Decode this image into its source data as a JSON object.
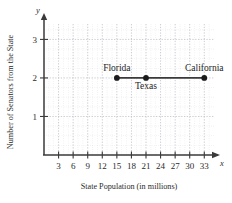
{
  "chart_data": {
    "type": "scatter",
    "title": "",
    "xlabel": "State Population (in millions)",
    "ylabel": "Number of Senators from the State",
    "xlim": [
      0,
      35
    ],
    "ylim": [
      0,
      3.4
    ],
    "xticks": [
      3,
      6,
      9,
      12,
      15,
      18,
      21,
      24,
      27,
      30,
      33
    ],
    "yticks": [
      1,
      2,
      3
    ],
    "xtick_labels": [
      "3",
      "6",
      "9",
      "12",
      "15",
      "18",
      "21",
      "24",
      "27",
      "30",
      "33"
    ],
    "ytick_labels": [
      "1",
      "2",
      "3"
    ],
    "x_axis_variable": "x",
    "y_axis_variable": "y",
    "grid": true,
    "grid_style": "dotted",
    "legend": "none",
    "connected": true,
    "line_color": "#3a3a3a",
    "point_color": "#1a1a1a",
    "axis_color": "#3a3a3a",
    "grid_color": "#cfcfd6",
    "points": [
      {
        "label": "Florida",
        "x": 15,
        "y": 2,
        "label_position": "above"
      },
      {
        "label": "Texas",
        "x": 21,
        "y": 2,
        "label_position": "below"
      },
      {
        "label": "California",
        "x": 33,
        "y": 2,
        "label_position": "above"
      }
    ],
    "series": [
      {
        "name": "States",
        "x": [
          15,
          21,
          33
        ],
        "values": [
          2,
          2,
          2
        ]
      }
    ]
  }
}
